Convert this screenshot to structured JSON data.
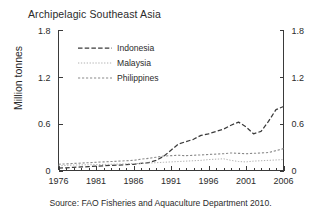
{
  "chart_data": {
    "type": "line",
    "title": "Archipelagic Southeast Asia",
    "xlabel": "",
    "ylabel": "Million tonnes",
    "source": "Source: FAO Fisheries and Aquaculture Department 2010.",
    "xlim": [
      1976,
      2006
    ],
    "ylim": [
      0,
      1.8
    ],
    "yticks": [
      "0",
      "0.6",
      "1.2",
      "1.8"
    ],
    "ytick_values": [
      0,
      0.6,
      1.2,
      1.8
    ],
    "xticks": [
      "1976",
      "1981",
      "1986",
      "1991",
      "1996",
      "2001",
      "2006"
    ],
    "xtick_values": [
      1976,
      1981,
      1986,
      1991,
      1996,
      2001,
      2006
    ],
    "x_minor_tick_interval": 1,
    "grid": false,
    "dual_y_axis": true,
    "right_yticks": [
      "0",
      "0.6",
      "1.2",
      "1.8"
    ],
    "legend_position": "upper-left-inside",
    "x": [
      1976,
      1977,
      1978,
      1979,
      1980,
      1981,
      1982,
      1983,
      1984,
      1985,
      1986,
      1987,
      1988,
      1989,
      1990,
      1991,
      1992,
      1993,
      1994,
      1995,
      1996,
      1997,
      1998,
      1999,
      2000,
      2001,
      2002,
      2003,
      2004,
      2005,
      2006
    ],
    "series": [
      {
        "name": "Indonesia",
        "style": "long-dash",
        "color": "#3b3b3b",
        "values": [
          0.03,
          0.035,
          0.04,
          0.045,
          0.05,
          0.055,
          0.06,
          0.065,
          0.07,
          0.075,
          0.08,
          0.09,
          0.1,
          0.13,
          0.18,
          0.26,
          0.34,
          0.37,
          0.4,
          0.45,
          0.47,
          0.5,
          0.53,
          0.58,
          0.62,
          0.56,
          0.47,
          0.5,
          0.63,
          0.78,
          0.82
        ]
      },
      {
        "name": "Malaysia",
        "style": "fine-dot",
        "color": "#b0b0b0",
        "values": [
          0.06,
          0.065,
          0.07,
          0.072,
          0.074,
          0.076,
          0.078,
          0.08,
          0.082,
          0.085,
          0.088,
          0.09,
          0.095,
          0.1,
          0.105,
          0.11,
          0.115,
          0.12,
          0.125,
          0.13,
          0.14,
          0.145,
          0.15,
          0.13,
          0.115,
          0.11,
          0.12,
          0.125,
          0.13,
          0.135,
          0.14
        ]
      },
      {
        "name": "Philippines",
        "style": "short-dash",
        "color": "#8a8a8a",
        "values": [
          0.08,
          0.085,
          0.09,
          0.095,
          0.1,
          0.105,
          0.11,
          0.115,
          0.12,
          0.125,
          0.13,
          0.145,
          0.155,
          0.17,
          0.185,
          0.19,
          0.195,
          0.19,
          0.195,
          0.2,
          0.205,
          0.21,
          0.215,
          0.225,
          0.22,
          0.215,
          0.22,
          0.225,
          0.23,
          0.255,
          0.28
        ]
      }
    ],
    "legend": [
      {
        "label": "Indonesia"
      },
      {
        "label": "Malaysia"
      },
      {
        "label": "Philippines"
      }
    ]
  }
}
